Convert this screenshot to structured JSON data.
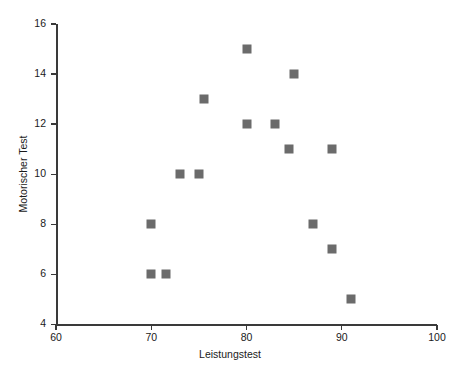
{
  "chart_data": {
    "type": "scatter",
    "title": "",
    "xlabel": "Leistungstest",
    "ylabel": "Motorischer Test",
    "xlim": [
      60,
      100
    ],
    "ylim": [
      4,
      16
    ],
    "xticks": [
      60,
      70,
      80,
      90,
      100
    ],
    "yticks": [
      4,
      6,
      8,
      10,
      12,
      14,
      16
    ],
    "xtick_labels": [
      "60",
      "70",
      "80",
      "90",
      "100"
    ],
    "ytick_labels": [
      "4",
      "6",
      "8",
      "10",
      "12",
      "14",
      "16"
    ],
    "grid": false,
    "legend": null,
    "marker": "square",
    "marker_color": "#6b6b6b",
    "axis_color": "#3a3a3a",
    "background_color": "#ffffff",
    "points": [
      {
        "x": 70,
        "y": 8
      },
      {
        "x": 70,
        "y": 6
      },
      {
        "x": 71.5,
        "y": 6
      },
      {
        "x": 73,
        "y": 10
      },
      {
        "x": 75,
        "y": 10
      },
      {
        "x": 75.5,
        "y": 13
      },
      {
        "x": 80,
        "y": 15
      },
      {
        "x": 80,
        "y": 12
      },
      {
        "x": 83,
        "y": 12
      },
      {
        "x": 85,
        "y": 14
      },
      {
        "x": 84.5,
        "y": 11
      },
      {
        "x": 89,
        "y": 11
      },
      {
        "x": 87,
        "y": 8
      },
      {
        "x": 89,
        "y": 7
      },
      {
        "x": 91,
        "y": 5
      }
    ]
  }
}
